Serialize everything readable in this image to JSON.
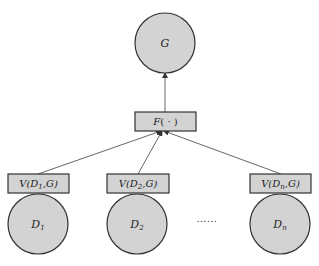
{
  "diagram": {
    "type": "aggregation-flow",
    "colors": {
      "node_fill": "#d3d3d3",
      "stroke": "#333333",
      "edge": "#555555"
    },
    "output_node": {
      "label": "G"
    },
    "aggregator": {
      "label_main": "F",
      "label_args": "( · )"
    },
    "sources": [
      {
        "name_main": "D",
        "name_sub": "1",
        "value_main": "V(D",
        "value_sub": "1",
        "value_tail": ",G)"
      },
      {
        "name_main": "D",
        "name_sub": "2",
        "value_main": "V(D",
        "value_sub": "2",
        "value_tail": ",G)"
      },
      {
        "name_main": "D",
        "name_sub": "n",
        "value_main": "V(D",
        "value_sub": "n",
        "value_tail": ",G)"
      }
    ],
    "ellipsis": "……",
    "edges": [
      {
        "from": "V(D1,G)",
        "to": "F(·)"
      },
      {
        "from": "V(D2,G)",
        "to": "F(·)"
      },
      {
        "from": "V(Dn,G)",
        "to": "F(·)"
      },
      {
        "from": "F(·)",
        "to": "G"
      }
    ]
  }
}
